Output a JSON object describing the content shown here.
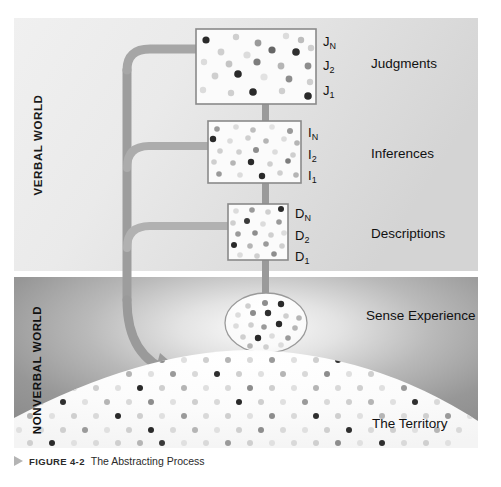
{
  "figure": {
    "caption_marker": "▶",
    "caption_label": "FIGURE 4-2",
    "caption_title": "The Abstracting Process"
  },
  "panels": {
    "verbal_world_label": "VERBAL WORLD",
    "nonverbal_world_label": "NONVERBAL WORLD"
  },
  "levels": [
    {
      "name": "judgments",
      "tick_top": "J",
      "tick_top_sub": "N",
      "tick_mid": "J",
      "tick_mid_sub": "2",
      "tick_bottom": "J",
      "tick_bottom_sub": "1",
      "label": "Judgments"
    },
    {
      "name": "inferences",
      "tick_top": "I",
      "tick_top_sub": "N",
      "tick_mid": "I",
      "tick_mid_sub": "2",
      "tick_bottom": "I",
      "tick_bottom_sub": "1",
      "label": "Inferences"
    },
    {
      "name": "descriptions",
      "tick_top": "D",
      "tick_top_sub": "N",
      "tick_mid": "D",
      "tick_mid_sub": "2",
      "tick_bottom": "D",
      "tick_bottom_sub": "1",
      "label": "Descriptions"
    }
  ],
  "sense_experience_label": "Sense Experience",
  "territory_label": "The Territory",
  "colors": {
    "verbal_bg_light": "#f2f2f2",
    "verbal_bg_dark": "#d7d7d7",
    "nonverbal_bg_dark": "#8e8e8e",
    "nonverbal_bg_light": "#f7f7f7",
    "box_fill": "#fbfbfb",
    "box_stroke": "#8a8a8a",
    "stem": "#9a9a9a",
    "arrow": "#9a9a9a",
    "text": "#1a1a1a",
    "caption_marker": "#b4b4b4"
  },
  "chart_data": {
    "type": "diagram",
    "title": "The Abstracting Process",
    "structure": "ladder of abstraction",
    "regions": [
      {
        "name": "VERBAL WORLD",
        "y_range_px": [
          18,
          271
        ]
      },
      {
        "name": "NONVERBAL WORLD",
        "y_range_px": [
          277,
          448
        ]
      }
    ],
    "nodes": [
      {
        "label": "Judgments",
        "shape": "rectangle",
        "level": 4,
        "box_px": [
          196,
          29,
          120,
          75
        ],
        "dots": 24
      },
      {
        "label": "Inferences",
        "shape": "rectangle",
        "level": 3,
        "box_px": [
          208,
          121,
          93,
          62
        ],
        "dots": 30
      },
      {
        "label": "Descriptions",
        "shape": "rectangle",
        "level": 2,
        "box_px": [
          228,
          204,
          60,
          56
        ],
        "dots": 22
      },
      {
        "label": "Sense Experience",
        "shape": "ellipse",
        "level": 1,
        "center_px": [
          266,
          323
        ],
        "radii_px": [
          41,
          30
        ],
        "dots": 22
      },
      {
        "label": "The Territory",
        "shape": "dome",
        "level": 0,
        "dots": 260
      }
    ],
    "edges": [
      {
        "from": "The Territory",
        "to": "Sense Experience",
        "style": "stem"
      },
      {
        "from": "Sense Experience",
        "to": "Descriptions",
        "style": "stem"
      },
      {
        "from": "Descriptions",
        "to": "Inferences",
        "style": "stem"
      },
      {
        "from": "Inferences",
        "to": "Judgments",
        "style": "stem"
      },
      {
        "from": "Judgments",
        "to": "The Territory",
        "style": "feedback-arrow"
      },
      {
        "from": "Inferences",
        "to": "The Territory",
        "style": "feedback-arrow"
      },
      {
        "from": "Descriptions",
        "to": "The Territory",
        "style": "feedback-arrow"
      }
    ]
  }
}
